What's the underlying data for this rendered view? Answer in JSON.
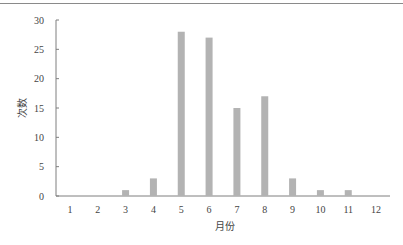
{
  "chart_data": {
    "type": "bar",
    "title": "",
    "xlabel": "月份",
    "ylabel": "次数",
    "categories": [
      "1",
      "2",
      "3",
      "4",
      "5",
      "6",
      "7",
      "8",
      "9",
      "10",
      "11",
      "12"
    ],
    "values": [
      0,
      0,
      1,
      3,
      28,
      27,
      15,
      17,
      3,
      1,
      1,
      0
    ],
    "ylim": [
      0,
      30
    ],
    "yticks": [
      0,
      5,
      10,
      15,
      20,
      25,
      30
    ],
    "grid": false,
    "legend": null,
    "bar_color": "#b3b3b3",
    "axis_color": "#7f7f7f"
  }
}
